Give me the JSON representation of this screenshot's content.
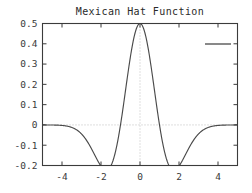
{
  "chart_data": {
    "type": "line",
    "title": "Mexican Hat Function",
    "xlabel": "",
    "ylabel": "",
    "xlim": [
      -5,
      5
    ],
    "ylim": [
      -0.2,
      0.5
    ],
    "grid": true,
    "grid_style": "dotted",
    "grid_lines": {
      "x": [
        0
      ],
      "y": [
        0
      ]
    },
    "legend": {
      "position": "top-right",
      "entries": [
        {
          "label": "",
          "style": "line",
          "color": "#4a4a4a"
        }
      ]
    },
    "xticks": [
      -4,
      -2,
      0,
      2,
      4
    ],
    "xtick_labels": [
      "-4",
      "-2",
      "0",
      "2",
      "4"
    ],
    "yticks": [
      0.5,
      0.4,
      0.3,
      0.2,
      0.1,
      0,
      -0.1,
      -0.2
    ],
    "ytick_labels": [
      "0.5",
      "0.4",
      "0.3",
      "0.2",
      "0.1",
      "0",
      "-0.1",
      "-0.2"
    ],
    "series": [
      {
        "name": "",
        "color": "#4a4a4a",
        "x": [
          -5.0,
          -4.8,
          -4.6,
          -4.4,
          -4.2,
          -4.0,
          -3.8,
          -3.6,
          -3.4,
          -3.2,
          -3.0,
          -2.8,
          -2.6,
          -2.4,
          -2.2,
          -2.0,
          -1.8,
          -1.6,
          -1.4,
          -1.2,
          -1.0,
          -0.8,
          -0.6,
          -0.4,
          -0.2,
          0.0,
          0.2,
          0.4,
          0.6,
          0.8,
          1.0,
          1.2,
          1.4,
          1.6,
          1.8,
          2.0,
          2.2,
          2.4,
          2.6,
          2.8,
          3.0,
          3.2,
          3.4,
          3.6,
          3.8,
          4.0,
          4.2,
          4.4,
          4.6,
          4.8,
          5.0
        ],
        "y": [
          -0.0078,
          -0.0107,
          -0.0143,
          -0.0188,
          -0.0242,
          -0.0305,
          -0.0378,
          -0.0459,
          -0.0547,
          -0.0639,
          -0.0733,
          -0.0823,
          -0.0905,
          -0.0973,
          -0.1019,
          -0.1037,
          -0.1017,
          -0.0953,
          -0.0837,
          -0.0663,
          -0.0428,
          -0.0132,
          0.0218,
          0.061,
          0.1023,
          0.1433,
          0.1815,
          0.2145,
          0.24,
          0.2562,
          0.262,
          0.2562,
          0.24,
          0.2145,
          0.1815,
          0.1433,
          0.1023,
          0.061,
          0.0218,
          -0.0132,
          -0.0428,
          -0.0663,
          -0.0837,
          -0.0953,
          -0.1017,
          -0.1037,
          -0.1019,
          -0.0973,
          -0.0905,
          -0.0823,
          -0.0733
        ],
        "peak_value": 0.5,
        "peak_x": 0,
        "min_value": -0.1,
        "min_x": [
          -2.3,
          2.3
        ]
      }
    ]
  },
  "axes": {
    "title_text": "Mexican Hat Function"
  }
}
